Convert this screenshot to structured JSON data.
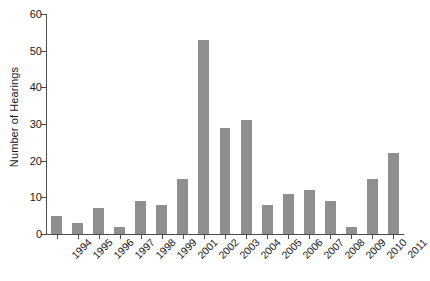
{
  "chart_data": {
    "type": "bar",
    "title": "",
    "xlabel": "",
    "ylabel": "Number of Hearings",
    "ylim": [
      0,
      60
    ],
    "yticks": [
      0,
      10,
      20,
      30,
      40,
      50,
      60
    ],
    "grid": false,
    "legend": null,
    "bar_color": "#8f8f8f",
    "axis_color": "#4d4d4d",
    "categories": [
      "1994",
      "1995",
      "1996",
      "1997",
      "1998",
      "1999",
      "2001",
      "2002",
      "2003",
      "2004",
      "2005",
      "2006",
      "2007",
      "2008",
      "2009",
      "2010",
      "2011"
    ],
    "values": [
      5,
      3,
      7,
      2,
      9,
      8,
      15,
      53,
      29,
      31,
      8,
      11,
      12,
      9,
      2,
      15,
      22
    ]
  }
}
